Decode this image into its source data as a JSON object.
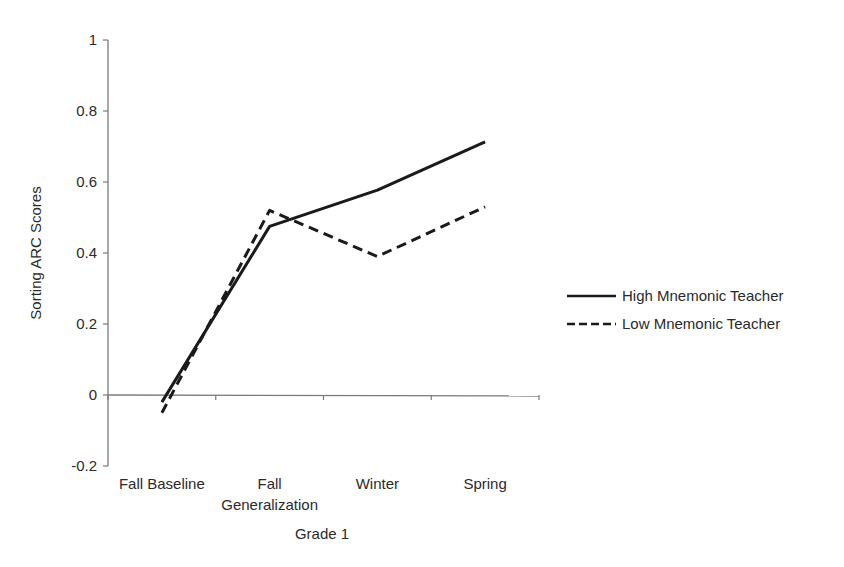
{
  "chart_data": {
    "type": "line",
    "title": "",
    "xlabel": "Grade 1",
    "ylabel": "Sorting ARC Scores",
    "categories": [
      "Fall Baseline",
      "Fall Generalization",
      "Winter",
      "Spring"
    ],
    "category_lines": [
      [
        "Fall Baseline"
      ],
      [
        "Fall",
        "Generalization"
      ],
      [
        "Winter"
      ],
      [
        "Spring"
      ]
    ],
    "ylim": [
      -0.2,
      1
    ],
    "yticks": [
      -0.2,
      0,
      0.2,
      0.4,
      0.6,
      0.8,
      1
    ],
    "ytick_labels": [
      "-0.2",
      "0",
      "0.2",
      "0.4",
      "0.6",
      "0.8",
      "1"
    ],
    "grid": false,
    "legend_position": "right",
    "series": [
      {
        "name": "High Mnemonic Teacher",
        "style": "solid",
        "color": "#1a1a1a",
        "values": [
          -0.02,
          0.475,
          0.577,
          0.713
        ]
      },
      {
        "name": "Low Mnemonic Teacher",
        "style": "dashed",
        "color": "#1a1a1a",
        "values": [
          -0.05,
          0.52,
          0.39,
          0.53
        ]
      }
    ]
  },
  "colors": {
    "axis": "#7a7a7a",
    "line": "#1a1a1a",
    "text": "#2a2a2a"
  }
}
